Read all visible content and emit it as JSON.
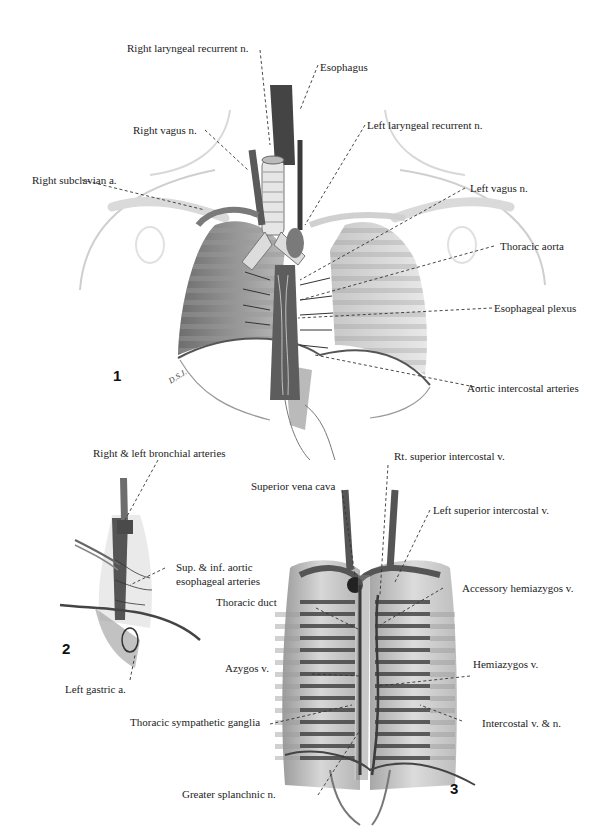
{
  "figures": [
    {
      "number": "1",
      "signature": "D.S.J.",
      "labels": [
        {
          "id": "right-laryngeal-recurrent-n",
          "text": "Right laryngeal recurrent n."
        },
        {
          "id": "esophagus",
          "text": "Esophagus"
        },
        {
          "id": "right-vagus-n",
          "text": "Right vagus n."
        },
        {
          "id": "left-laryngeal-recurrent-n",
          "text": "Left laryngeal recurrent n."
        },
        {
          "id": "right-subclavian-a",
          "text": "Right subclavian a."
        },
        {
          "id": "left-vagus-n",
          "text": "Left vagus n."
        },
        {
          "id": "thoracic-aorta",
          "text": "Thoracic aorta"
        },
        {
          "id": "esophageal-plexus",
          "text": "Esophageal plexus"
        },
        {
          "id": "aortic-intercostal-arteries",
          "text": "Aortic intercostal arteries"
        }
      ]
    },
    {
      "number": "2",
      "labels": [
        {
          "id": "right-left-bronchial-arteries",
          "text": "Right & left bronchial arteries"
        },
        {
          "id": "sup-inf-aortic-esophageal-arteries",
          "line1": "Sup. & inf. aortic",
          "line2": "esophageal arteries"
        },
        {
          "id": "left-gastric-a",
          "text": "Left gastric a."
        }
      ]
    },
    {
      "number": "3",
      "labels": [
        {
          "id": "rt-superior-intercostal-v",
          "text": "Rt. superior intercostal v."
        },
        {
          "id": "superior-vena-cava",
          "text": "Superior vena cava"
        },
        {
          "id": "left-superior-intercostal-v",
          "text": "Left superior intercostal v."
        },
        {
          "id": "accessory-hemiazygos-v",
          "text": "Accessory hemiazygos v."
        },
        {
          "id": "thoracic-duct",
          "text": "Thoracic duct"
        },
        {
          "id": "azygos-v",
          "text": "Azygos v."
        },
        {
          "id": "hemiazygos-v",
          "text": "Hemiazygos v."
        },
        {
          "id": "thoracic-sympathetic-ganglia",
          "text": "Thoracic sympathetic ganglia"
        },
        {
          "id": "intercostal-v-n",
          "text": "Intercostal v. & n."
        },
        {
          "id": "greater-splanchnic-n",
          "text": "Greater splanchnic n."
        }
      ]
    }
  ]
}
